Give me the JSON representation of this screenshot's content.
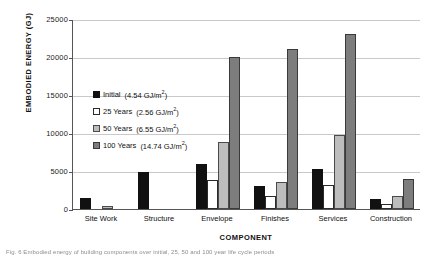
{
  "chart_data": {
    "type": "bar",
    "title": "",
    "xlabel": "COMPONENT",
    "ylabel": "EMBODIED ENERGY (GJ)",
    "ylim": [
      0,
      25000
    ],
    "yticks": [
      0,
      5000,
      10000,
      15000,
      20000,
      25000
    ],
    "ytick_labels": [
      "0",
      "5000",
      "10000",
      "15000",
      "20000",
      "25000"
    ],
    "grid": true,
    "legend_position": "upper-left-inside",
    "categories": [
      "Site Work",
      "Structure",
      "Envelope",
      "Finishes",
      "Services",
      "Construction"
    ],
    "series": [
      {
        "name": "Initial",
        "value_label": "(4.54 GJ/m²)",
        "color": "#111111",
        "values": [
          1400,
          4900,
          5900,
          3000,
          5200,
          1300
        ]
      },
      {
        "name": "25 Years",
        "value_label": "(2.56 GJ/m²)",
        "color": "#ffffff",
        "values": [
          0,
          0,
          3800,
          1700,
          3100,
          600
        ]
      },
      {
        "name": "50 Years",
        "value_label": "(6.55 GJ/m²)",
        "color": "#bdbdbd",
        "values": [
          400,
          0,
          8800,
          3500,
          9800,
          1700
        ]
      },
      {
        "name": "100 Years",
        "value_label": "(14.74 GJ/m²)",
        "color": "#7d7d7d",
        "values": [
          0,
          0,
          20000,
          21000,
          23000,
          3900
        ]
      }
    ]
  },
  "legend": {
    "entries": [
      {
        "label": "Initial",
        "value": "(4.54 GJ/m",
        "unit_sup": "2",
        "tail": ")"
      },
      {
        "label": "25 Years",
        "value": "(2.56 GJ/m",
        "unit_sup": "2",
        "tail": ")"
      },
      {
        "label": "50 Years",
        "value": "(6.55 GJ/m",
        "unit_sup": "2",
        "tail": ")"
      },
      {
        "label": "100 Years",
        "value": "(14.74 GJ/m",
        "unit_sup": "2",
        "tail": ")"
      }
    ]
  },
  "caption": {
    "text": "Fig. 6  Embodied energy of building components over initial, 25, 50 and 100 year life cycle periods"
  }
}
